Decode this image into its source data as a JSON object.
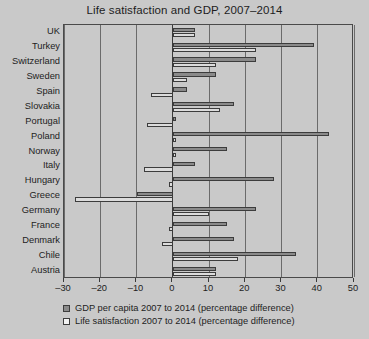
{
  "chart_data": {
    "type": "bar",
    "orientation": "horizontal",
    "title": "Life satisfaction and GDP, 2007–2014",
    "xlabel": "",
    "ylabel": "",
    "xlim": [
      -30,
      50
    ],
    "xticks": [
      -30,
      -20,
      -10,
      0,
      10,
      20,
      30,
      40,
      50
    ],
    "xticklabels": [
      "–30",
      "–20",
      "–10",
      "0",
      "10",
      "20",
      "30",
      "40",
      "50"
    ],
    "grid": true,
    "legend_position": "below",
    "categories": [
      "UK",
      "Turkey",
      "Switzerland",
      "Sweden",
      "Spain",
      "Slovakia",
      "Portugal",
      "Poland",
      "Norway",
      "Italy",
      "Hungary",
      "Greece",
      "Germany",
      "France",
      "Denmark",
      "Chile",
      "Austria"
    ],
    "series": [
      {
        "name": "GDP per capita 2007 to 2014 (percentage difference)",
        "color": "#8a8a8a",
        "values": [
          6,
          39,
          23,
          12,
          4,
          17,
          1,
          43,
          15,
          6,
          28,
          -10,
          23,
          15,
          17,
          34,
          12
        ]
      },
      {
        "name": "Life satisfaction 2007 to 2014 (percentage difference)",
        "color": "#dcdcdc",
        "values": [
          6,
          23,
          12,
          4,
          -6,
          13,
          -7,
          1,
          1,
          -8,
          -1,
          -27,
          10,
          -1,
          -3,
          18,
          12
        ]
      }
    ]
  },
  "legend": {
    "items": [
      {
        "label": "GDP per capita 2007 to 2014 (percentage difference)",
        "swatch": "gdp"
      },
      {
        "label": "Life satisfaction 2007 to 2014 (percentage difference)",
        "swatch": "sat"
      }
    ]
  }
}
